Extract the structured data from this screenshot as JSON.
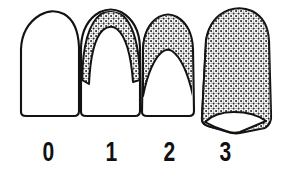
{
  "figure": {
    "kind": "dental-grading-diagram",
    "background_color": "#ffffff",
    "outline_color": "#131313",
    "stipple_dot_color": "#2b2b2b",
    "stipple_field_color": "#ffffff"
  },
  "teeth": [
    {
      "grade": "0",
      "label": "0",
      "stipple_coverage": "none",
      "description": "Tooth outline with no stippled area"
    },
    {
      "grade": "1",
      "label": "1",
      "stipple_coverage": "thin band along incisal/occlusal arch",
      "description": "Narrow stippled crescent following the upper contour"
    },
    {
      "grade": "2",
      "label": "2",
      "stipple_coverage": "upper half of crown",
      "description": "Stippled area covering roughly the upper half of the crown with a domed white area below"
    },
    {
      "grade": "3",
      "label": "3",
      "stipple_coverage": "nearly entire crown",
      "description": "Stippling covering almost the whole crown, leaving a small white notch at the base"
    }
  ],
  "labels": {
    "values": [
      "0",
      "1",
      "2",
      "3"
    ]
  }
}
